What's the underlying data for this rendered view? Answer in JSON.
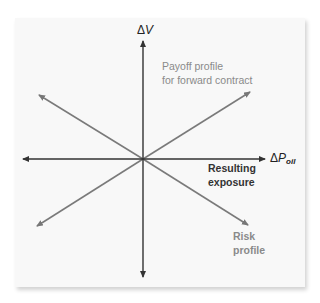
{
  "diagram": {
    "type": "risk-hedging-diagram",
    "axes": {
      "y_label_symbol": "Δ",
      "y_label_var": "V",
      "x_label_symbol": "Δ",
      "x_label_var": "P",
      "x_label_sub": "oil"
    },
    "labels": {
      "payoff_line1": "Payoff profile",
      "payoff_line2": "for forward contract",
      "result_line1": "Resulting",
      "result_line2": "exposure",
      "risk_line1": "Risk",
      "risk_line2": "profile"
    },
    "lines": [
      {
        "name": "payoff-profile",
        "direction": "upward-sloping",
        "color": "#7a7a7a"
      },
      {
        "name": "risk-profile",
        "direction": "downward-sloping",
        "color": "#7a7a7a"
      },
      {
        "name": "resulting-exposure",
        "direction": "horizontal",
        "color": "#333333"
      }
    ],
    "colors": {
      "axis": "#333333",
      "profile_line": "#7a7a7a",
      "card_bg": "#f8f8f8"
    }
  }
}
